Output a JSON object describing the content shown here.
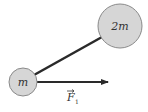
{
  "diagram": {
    "small_mass": {
      "label": "m",
      "cx": 23,
      "cy": 82,
      "r": 14
    },
    "large_mass": {
      "label": "2m",
      "cx": 120,
      "cy": 26,
      "r": 22
    },
    "rod": {
      "x1": 34,
      "y1": 75,
      "x2": 102,
      "y2": 37
    },
    "force": {
      "symbol": "F",
      "subscript": "1",
      "x1": 37,
      "y1": 82,
      "x2": 109,
      "y2": 82
    },
    "colors": {
      "mass_fill": "#d6d6d6",
      "mass_stroke": "#8a8a8a",
      "rod": "#2a2a2a",
      "arrow": "#2a2a2a",
      "text": "#333333"
    }
  }
}
